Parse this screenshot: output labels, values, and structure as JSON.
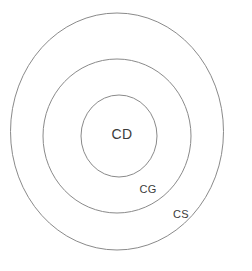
{
  "diagram": {
    "background_color": "#ffffff",
    "stroke_color": "#8a8a8a",
    "text_color": "#3b3b3b",
    "rings": [
      {
        "id": "outer",
        "label": "CS",
        "cx": 117,
        "cy": 131.5,
        "rx": 106.5,
        "ry": 118.5,
        "label_x": 181,
        "label_y": 214
      },
      {
        "id": "middle",
        "label": "CG",
        "cx": 117,
        "cy": 136,
        "rx": 74,
        "ry": 77,
        "label_x": 148,
        "label_y": 189
      },
      {
        "id": "inner",
        "label": "CD",
        "cx": 119,
        "cy": 136,
        "rx": 38,
        "ry": 41,
        "label_x": 122,
        "label_y": 134
      }
    ]
  }
}
